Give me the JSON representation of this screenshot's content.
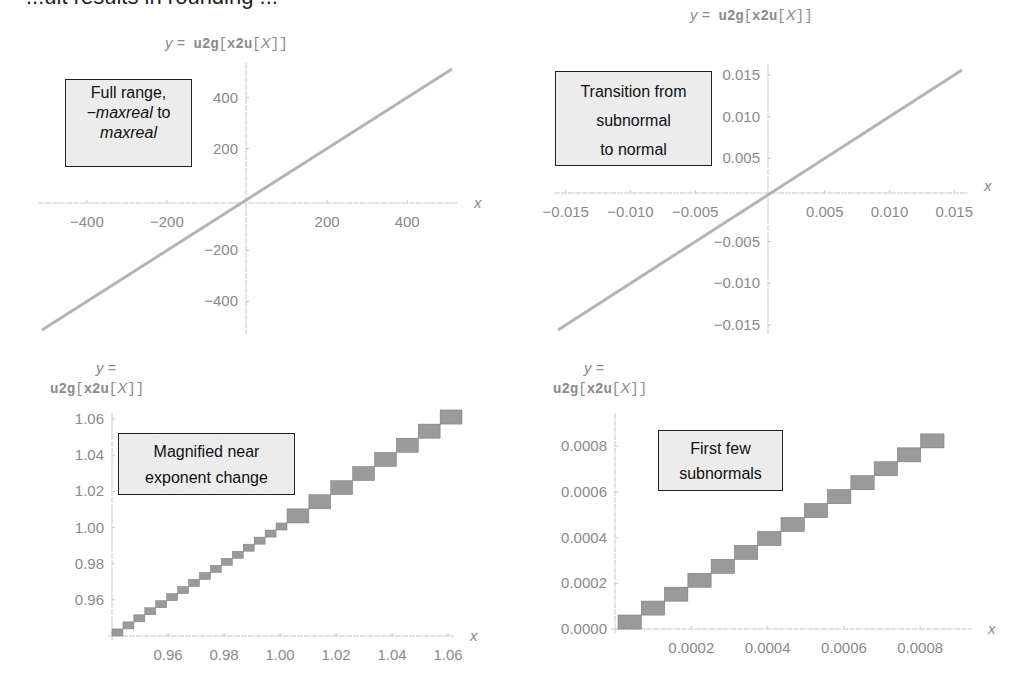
{
  "page": {
    "clipped_heading": "...ult results in rounding ..."
  },
  "plot_title_parts": {
    "y_eq": "y =",
    "func_outer": "u2g",
    "bracket_open": "[",
    "func_inner": "x2u",
    "arg": "X",
    "bracket_close": "]]"
  },
  "callouts": {
    "tl": {
      "line1": "Full range,",
      "line2_italic": "−maxreal",
      "line2_rest": " to",
      "line3_italic": "maxreal"
    },
    "tr": {
      "line1": "Transition from",
      "line2": "subnormal",
      "line3": "to normal"
    },
    "bl": {
      "line1": "Magnified near",
      "line2": "exponent change"
    },
    "br": {
      "line1": "First few",
      "line2": "subnormals"
    }
  },
  "colors": {
    "line": "#b4b4b4",
    "step_fill": "#9a9a9a",
    "step_edge": "#7a7a7a",
    "axis": "#c8c8c8",
    "tick_text": "#8a8a8a",
    "callout_bg": "#ececec"
  },
  "chart_data": [
    {
      "id": "top-left",
      "type": "line",
      "title": "y = u2g[x2u[X]]",
      "annotation": "Full range, −maxreal to maxreal",
      "xlabel": "X",
      "ylabel": "",
      "xlim": [
        -512,
        512
      ],
      "ylim": [
        -512,
        512
      ],
      "xticks": [
        -400,
        -200,
        200,
        400
      ],
      "yticks": [
        400,
        200,
        -200,
        -400
      ],
      "x": [
        -512,
        512
      ],
      "y": [
        -512,
        512
      ],
      "grid": false
    },
    {
      "id": "top-right",
      "type": "line",
      "title": "y = u2g[x2u[X]]",
      "annotation": "Transition from subnormal to normal",
      "xlabel": "X",
      "ylabel": "",
      "xlim": [
        -0.0156,
        0.0156
      ],
      "ylim": [
        -0.0156,
        0.0156
      ],
      "xticks": [
        -0.015,
        -0.01,
        -0.005,
        0.005,
        0.01,
        0.015
      ],
      "xtick_labels": [
        "−0.015",
        "−0.010",
        "−0.005",
        "0.005",
        "0.010",
        "0.015"
      ],
      "yticks": [
        0.015,
        0.01,
        0.005,
        -0.005,
        -0.01,
        -0.015
      ],
      "ytick_labels": [
        "0.015",
        "0.010",
        "0.005",
        "−0.005",
        "−0.010",
        "−0.015"
      ],
      "x": [
        -0.0156,
        0.0156
      ],
      "y": [
        -0.0156,
        0.0156
      ],
      "grid": false
    },
    {
      "id": "bottom-left",
      "type": "step",
      "title": "y = u2g[x2u[X]]",
      "annotation": "Magnified near exponent change",
      "xlabel": "X",
      "ylabel": "",
      "xlim": [
        0.94,
        1.06
      ],
      "ylim": [
        0.94,
        1.06
      ],
      "xticks": [
        0.96,
        0.98,
        1.0,
        1.02,
        1.04,
        1.06
      ],
      "xtick_labels": [
        "0.96",
        "0.98",
        "1.00",
        "1.02",
        "1.04",
        "1.06"
      ],
      "yticks": [
        1.06,
        1.04,
        1.02,
        1.0,
        0.98,
        0.96
      ],
      "ytick_labels": [
        "1.06",
        "1.04",
        "1.02",
        "1.00",
        "0.98",
        "0.96"
      ],
      "step_below_1": 0.00390625,
      "step_above_1": 0.0078125,
      "grid": false
    },
    {
      "id": "bottom-right",
      "type": "step",
      "title": "y = u2g[x2u[X]]",
      "annotation": "First few subnormals",
      "xlabel": "X",
      "ylabel": "",
      "xlim": [
        0,
        0.00092
      ],
      "ylim": [
        0,
        0.00092
      ],
      "xticks": [
        0.0002,
        0.0004,
        0.0006,
        0.0008
      ],
      "xtick_labels": [
        "0.0002",
        "0.0004",
        "0.0006",
        "0.0008"
      ],
      "yticks": [
        0.0008,
        0.0006,
        0.0004,
        0.0002,
        0.0
      ],
      "ytick_labels": [
        "0.0008",
        "0.0006",
        "0.0004",
        "0.0002",
        "0.0000"
      ],
      "step_size": 6.103515625e-05,
      "num_steps": 14,
      "grid": false
    }
  ]
}
